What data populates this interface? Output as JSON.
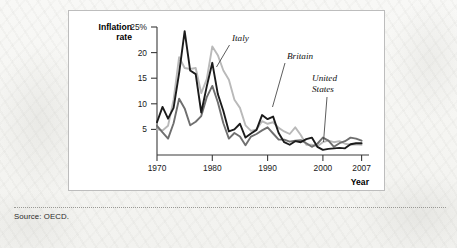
{
  "figure": {
    "source_note": "Source: OECD."
  },
  "chart_data": {
    "type": "line",
    "title": "",
    "xlabel": "Year",
    "ylabel": "Inflation rate",
    "ylabel_line1": "Inflation",
    "ylabel_line2": "rate",
    "xlim": [
      1970,
      2007
    ],
    "ylim": [
      0,
      25
    ],
    "grid": false,
    "legend_position": "inline-annotations",
    "y_ticks": [
      5,
      10,
      15,
      20,
      25
    ],
    "y_tick_labels": [
      "5",
      "10",
      "15",
      "20",
      "25%"
    ],
    "x_ticks": [
      1970,
      1980,
      1990,
      2000,
      2007
    ],
    "x_tick_labels": [
      "1970",
      "1980",
      "1990",
      "2000",
      "2007"
    ],
    "x": [
      1970,
      1971,
      1972,
      1973,
      1974,
      1975,
      1976,
      1977,
      1978,
      1979,
      1980,
      1981,
      1982,
      1983,
      1984,
      1985,
      1986,
      1987,
      1988,
      1989,
      1990,
      1991,
      1992,
      1993,
      1994,
      1995,
      1996,
      1997,
      1998,
      1999,
      2000,
      2001,
      2002,
      2003,
      2004,
      2005,
      2006,
      2007
    ],
    "series": [
      {
        "name": "Italy",
        "color": "#b9b9b9",
        "values": [
          5.0,
          4.8,
          5.7,
          10.8,
          19.1,
          17.0,
          16.8,
          17.0,
          12.1,
          14.8,
          21.2,
          19.5,
          16.5,
          14.7,
          10.8,
          9.2,
          5.8,
          4.7,
          5.0,
          6.6,
          6.1,
          6.4,
          5.3,
          4.6,
          4.1,
          5.4,
          3.9,
          2.0,
          2.0,
          1.7,
          2.5,
          2.8,
          2.5,
          2.7,
          2.2,
          2.0,
          2.1,
          2.0
        ]
      },
      {
        "name": "Britain",
        "color": "#1b1b1b",
        "values": [
          6.4,
          9.4,
          7.1,
          9.2,
          16.0,
          24.2,
          16.5,
          15.8,
          8.3,
          13.4,
          18.0,
          11.9,
          8.6,
          4.6,
          5.0,
          6.1,
          3.4,
          4.2,
          4.9,
          7.8,
          7.0,
          7.5,
          4.3,
          2.5,
          2.0,
          2.7,
          2.5,
          3.1,
          3.4,
          1.6,
          1.0,
          1.2,
          1.3,
          1.4,
          1.3,
          2.1,
          2.3,
          2.3
        ]
      },
      {
        "name": "United States",
        "color": "#6f6f6f",
        "values": [
          5.7,
          4.4,
          3.2,
          6.2,
          11.0,
          9.1,
          5.8,
          6.5,
          7.6,
          11.3,
          13.5,
          10.3,
          6.2,
          3.2,
          4.3,
          3.6,
          1.9,
          3.6,
          4.1,
          4.8,
          5.4,
          4.2,
          3.0,
          3.0,
          2.6,
          2.8,
          2.9,
          2.3,
          1.6,
          2.2,
          3.4,
          2.8,
          1.6,
          2.3,
          2.7,
          3.4,
          3.2,
          2.8
        ]
      }
    ],
    "annotations": [
      {
        "text": "Italy",
        "series": "Italy"
      },
      {
        "text": "Britain",
        "series": "Britain"
      },
      {
        "text": "United States",
        "series": "United States",
        "line1": "United",
        "line2": "States"
      }
    ]
  }
}
